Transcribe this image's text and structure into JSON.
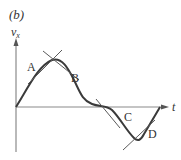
{
  "figure": {
    "panel_label": "(b)",
    "y_axis_label": "v",
    "y_axis_subscript": "x",
    "x_axis_label": "t",
    "points": [
      {
        "id": "A",
        "label": "A"
      },
      {
        "id": "B",
        "label": "B"
      },
      {
        "id": "C",
        "label": "C"
      },
      {
        "id": "D",
        "label": "D"
      }
    ],
    "colors": {
      "axis": "#8a8a8a",
      "curve": "#3a3a3a",
      "tangent": "#5a5a5a",
      "text": "#333333"
    }
  }
}
